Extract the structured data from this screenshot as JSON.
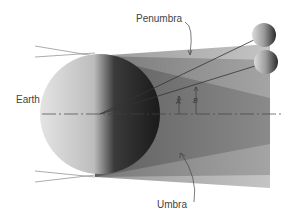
{
  "diagram": {
    "labels": {
      "earth": "Earth",
      "penumbra": "Penumbra",
      "umbra": "Umbra",
      "angle_a": "A",
      "angle_b": "B"
    },
    "colors": {
      "background": "#ffffff",
      "penumbra_fill": "#b8b8b8",
      "umbra_fill": "#7a7a7a",
      "earth_light": "#d8d8d8",
      "earth_dark": "#1a1a1a",
      "line": "#555555",
      "text": "#444444"
    }
  }
}
